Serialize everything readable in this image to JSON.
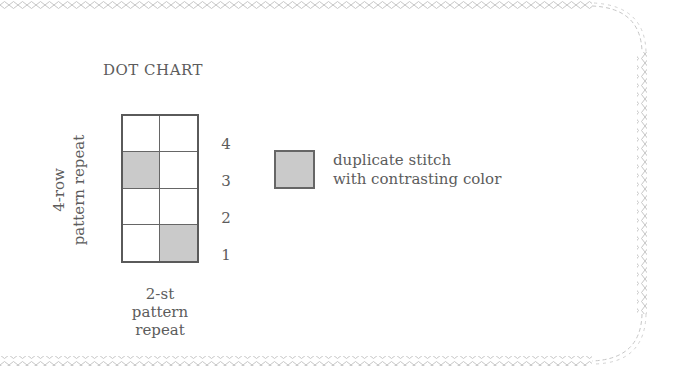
{
  "title": "DOT CHART",
  "axes": {
    "vertical_label_line1": "4-row",
    "vertical_label_line2": "pattern repeat",
    "horizontal_label_line1": "2-st",
    "horizontal_label_line2": "pattern",
    "horizontal_label_line3": "repeat"
  },
  "grid": {
    "columns": 2,
    "rows": 4,
    "row_labels": [
      "4",
      "3",
      "2",
      "1"
    ],
    "cells": [
      [
        false,
        false
      ],
      [
        true,
        false
      ],
      [
        false,
        false
      ],
      [
        false,
        true
      ]
    ],
    "fill_color": "#cacaca",
    "line_color": "#5a5a5a"
  },
  "legend": {
    "swatch_color": "#cacaca",
    "line1": "duplicate stitch",
    "line2": "with contrasting color"
  },
  "border": {
    "style": "diamond-chain",
    "color": "#c4c4c4"
  }
}
